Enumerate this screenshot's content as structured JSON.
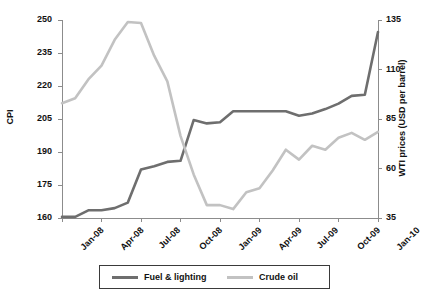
{
  "chart_data": {
    "type": "line",
    "title": "",
    "xlabel": "",
    "ylabel": "CPI",
    "y2label": "WTI prices (USD per barrel)",
    "grid": false,
    "legend_position": "bottom",
    "ylim": [
      160,
      250
    ],
    "y2lim": [
      35,
      135
    ],
    "yticks": [
      "160",
      "175",
      "190",
      "205",
      "220",
      "235",
      "250"
    ],
    "y2ticks": [
      "35",
      "60",
      "85",
      "110",
      "135"
    ],
    "xticks": [
      "Jan-08",
      "Apr-08",
      "Jul-08",
      "Oct-08",
      "Jan-09",
      "Apr-09",
      "Jul-09",
      "Oct-09",
      "Jan-10"
    ],
    "x": [
      "Jan-08",
      "Feb-08",
      "Mar-08",
      "Apr-08",
      "May-08",
      "Jun-08",
      "Jul-08",
      "Aug-08",
      "Sep-08",
      "Oct-08",
      "Nov-08",
      "Dec-08",
      "Jan-09",
      "Feb-09",
      "Mar-09",
      "Apr-09",
      "May-09",
      "Jun-09",
      "Jul-09",
      "Aug-09",
      "Sep-09",
      "Oct-09",
      "Nov-09",
      "Dec-09",
      "Jan-10"
    ],
    "series": [
      {
        "name": "Fuel & lighting",
        "axis": "left",
        "color": "#6e6e6e",
        "values": [
          160.5,
          160.5,
          163.5,
          163.5,
          164.5,
          167.0,
          182.0,
          183.5,
          185.5,
          186.0,
          204.5,
          203.0,
          203.5,
          208.5,
          208.5,
          208.5,
          208.5,
          208.5,
          206.5,
          207.5,
          209.5,
          212.0,
          215.5,
          216.0,
          244.5
        ]
      },
      {
        "name": "Crude oil",
        "axis": "right",
        "color": "#c2c2c2",
        "values": [
          93.0,
          95.5,
          105.0,
          112.0,
          125.0,
          134.0,
          133.5,
          117.0,
          104.0,
          76.5,
          57.0,
          41.5,
          41.5,
          39.5,
          48.0,
          50.0,
          59.0,
          69.5,
          64.5,
          71.5,
          69.5,
          75.5,
          78.0,
          74.5,
          78.5
        ]
      }
    ]
  },
  "legend": {
    "items": [
      {
        "label": "Fuel & lighting",
        "color": "#6e6e6e"
      },
      {
        "label": "Crude oil",
        "color": "#c2c2c2"
      }
    ]
  },
  "axes": {
    "left_title": "CPI",
    "right_title": "WTI prices (USD per barrel)"
  }
}
